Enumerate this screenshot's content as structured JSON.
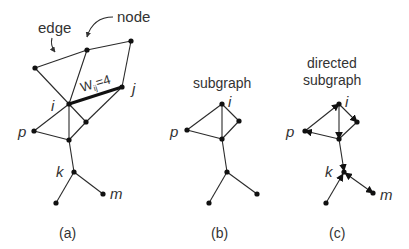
{
  "annotations": {
    "edge_label": "edge",
    "node_label": "node",
    "weight_label_main": "W",
    "weight_label_sub": "ij",
    "weight_label_value": "=4"
  },
  "panels": [
    {
      "id": "a",
      "caption": "(a)",
      "title": "",
      "node_labels": {
        "i": "i",
        "j": "j",
        "p": "p",
        "k": "k",
        "m": "m"
      }
    },
    {
      "id": "b",
      "caption": "(b)",
      "title": "subgraph",
      "node_labels": {
        "i": "i",
        "p": "p"
      }
    },
    {
      "id": "c",
      "caption": "(c)",
      "title_line1": "directed",
      "title_line2": "subgraph",
      "node_labels": {
        "i": "i",
        "p": "p",
        "k": "k",
        "m": "m"
      }
    }
  ],
  "colors": {
    "ink": "#111111",
    "text": "#333333",
    "background": "#ffffff"
  }
}
